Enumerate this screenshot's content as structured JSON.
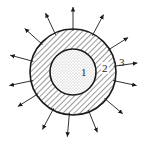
{
  "diagram": {
    "center": [
      73,
      72
    ],
    "outer_radius": 43,
    "inner_radius": 23,
    "arrow_length": 22,
    "arrow_angles_deg": [
      -90,
      -62,
      -32,
      -8,
      12,
      40,
      68,
      95,
      118,
      148,
      168,
      195,
      222,
      245
    ],
    "colors": {
      "stroke": "#1a1a1a",
      "dots": "#555555",
      "hatch": "#333333"
    },
    "labels": [
      {
        "id": "1",
        "text": "1",
        "x": 82,
        "y": 75
      },
      {
        "id": "2",
        "text": "2",
        "x": 104,
        "y": 72
      },
      {
        "id": "3",
        "text": "3",
        "x": 120,
        "y": 66
      }
    ],
    "regions": [
      {
        "id": "1",
        "name": "core",
        "fill": "stippled"
      },
      {
        "id": "2",
        "name": "shell",
        "fill": "hatched"
      },
      {
        "id": "3",
        "name": "surface",
        "fill": "none"
      }
    ]
  }
}
